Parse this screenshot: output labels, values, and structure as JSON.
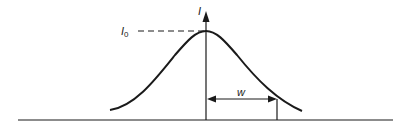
{
  "diagram": {
    "type": "gaussian-intensity-profile",
    "axis_label": "I",
    "peak_label": "I",
    "peak_label_subscript": "0",
    "width_label": "w",
    "colors": {
      "stroke": "#1a1a1a",
      "background": "#ffffff"
    }
  }
}
